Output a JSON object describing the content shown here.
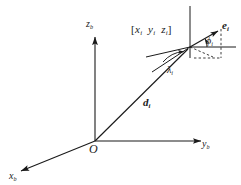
{
  "figure": {
    "background_color": "#ffffff",
    "stroke_color": "#1a1a1a",
    "labels": {
      "origin": "O",
      "axis_x": {
        "base": "x",
        "sub": "b"
      },
      "axis_y": {
        "base": "y",
        "sub": "b"
      },
      "axis_z": {
        "base": "z",
        "sub": "b"
      },
      "range_vector": {
        "base": "d",
        "sub": "i"
      },
      "unit_vector": {
        "base": "e",
        "sub": "i"
      },
      "angle_phi": {
        "base": "ϕ",
        "sub": "i"
      },
      "angle_lambda": {
        "base": "λ",
        "sub": "i"
      },
      "point_coords": {
        "open": "[",
        "x": "x",
        "x_sub": "i",
        "y": "y",
        "y_sub": "i",
        "z": "z",
        "z_sub": "i",
        "close": "]"
      }
    },
    "geometry": {
      "origin_px": [
        95,
        141
      ],
      "point_px": [
        190,
        47
      ],
      "axis_z_tip_px": [
        95,
        34
      ],
      "axis_y_tip_px": [
        205,
        141
      ],
      "axis_x_tip_px": [
        17,
        173
      ]
    }
  }
}
